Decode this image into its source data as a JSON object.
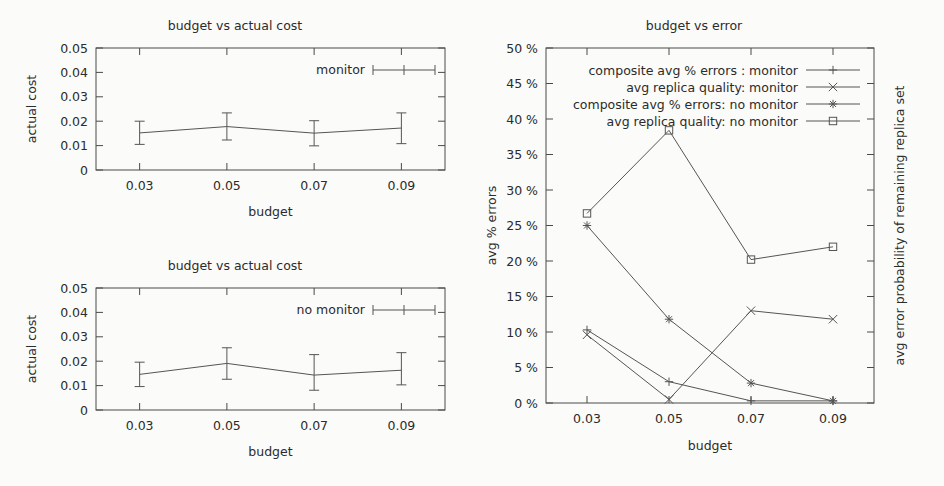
{
  "page": {
    "background": "#fbfbf9",
    "ink": "#2b2b2b",
    "line_color": "#555555"
  },
  "chart_data": [
    {
      "id": "budget-vs-actual-cost-monitor",
      "type": "line",
      "title": "budget vs actual cost",
      "xlabel": "budget",
      "ylabel": "actual cost",
      "legend": [
        "monitor"
      ],
      "legend_position": "top-right",
      "grid": false,
      "x": [
        0.03,
        0.05,
        0.07,
        0.09
      ],
      "xtick_labels": [
        "0.03",
        "0.05",
        "0.07",
        "0.09"
      ],
      "xlim": [
        0.02,
        0.1
      ],
      "ytick_labels": [
        "0",
        "0.01",
        "0.02",
        "0.03",
        "0.04",
        "0.05"
      ],
      "ytick_values": [
        0,
        0.01,
        0.02,
        0.03,
        0.04,
        0.05
      ],
      "ylim": [
        0,
        0.05
      ],
      "series": [
        {
          "name": "monitor",
          "marker": "errorbar",
          "values": [
            0.0152,
            0.0178,
            0.0151,
            0.0172
          ],
          "err_low": [
            0.0105,
            0.0123,
            0.0099,
            0.0108
          ],
          "err_high": [
            0.02,
            0.0234,
            0.0202,
            0.0234
          ]
        }
      ]
    },
    {
      "id": "budget-vs-actual-cost-no-monitor",
      "type": "line",
      "title": "budget vs actual cost",
      "xlabel": "budget",
      "ylabel": "actual cost",
      "legend": [
        "no monitor"
      ],
      "legend_position": "top-right",
      "grid": false,
      "x": [
        0.03,
        0.05,
        0.07,
        0.09
      ],
      "xtick_labels": [
        "0.03",
        "0.05",
        "0.07",
        "0.09"
      ],
      "xlim": [
        0.02,
        0.1
      ],
      "ytick_labels": [
        "0",
        "0.01",
        "0.02",
        "0.03",
        "0.04",
        "0.05"
      ],
      "ytick_values": [
        0,
        0.01,
        0.02,
        0.03,
        0.04,
        0.05
      ],
      "ylim": [
        0,
        0.05
      ],
      "series": [
        {
          "name": "no monitor",
          "marker": "errorbar",
          "values": [
            0.0146,
            0.0191,
            0.0143,
            0.0163
          ],
          "err_low": [
            0.0096,
            0.0126,
            0.0081,
            0.0103
          ],
          "err_high": [
            0.0196,
            0.0255,
            0.0227,
            0.0235
          ]
        }
      ]
    },
    {
      "id": "budget-vs-error",
      "type": "line",
      "title": "budget vs error",
      "xlabel": "budget",
      "ylabel": "avg % errors",
      "ylabel_right": "avg error probability of remaining replica set",
      "legend_position": "top-center",
      "grid": false,
      "x": [
        0.03,
        0.05,
        0.07,
        0.09
      ],
      "xtick_labels": [
        "0.03",
        "0.05",
        "0.07",
        "0.09"
      ],
      "xlim": [
        0.02,
        0.1
      ],
      "ytick_labels": [
        "0 %",
        "5 %",
        "10 %",
        "15 %",
        "20 %",
        "25 %",
        "30 %",
        "35 %",
        "40 %",
        "45 %",
        "50 %"
      ],
      "ytick_values": [
        0,
        5,
        10,
        15,
        20,
        25,
        30,
        35,
        40,
        45,
        50
      ],
      "ylim": [
        0,
        50
      ],
      "series": [
        {
          "name": "composite avg % errors : monitor",
          "marker": "plus",
          "values": [
            10.3,
            3.0,
            0.3,
            0.3
          ]
        },
        {
          "name": "avg replica quality: monitor",
          "marker": "cross",
          "values": [
            9.6,
            0.5,
            13.0,
            11.8
          ]
        },
        {
          "name": "composite avg % errors: no monitor",
          "marker": "star",
          "values": [
            25.0,
            11.8,
            2.8,
            0.3
          ]
        },
        {
          "name": "avg replica quality: no monitor",
          "marker": "square",
          "values": [
            26.7,
            38.4,
            20.2,
            22.0
          ]
        }
      ]
    }
  ]
}
